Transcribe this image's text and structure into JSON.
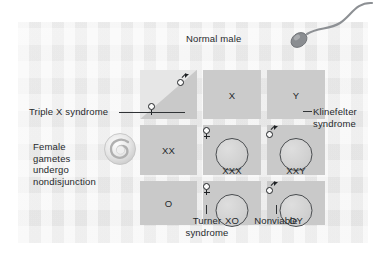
{
  "figure": {
    "title_label": "Normal male",
    "grid": {
      "corner_cell": {
        "male_symbol": "male-symbol",
        "female_symbol": "female-symbol"
      },
      "column_headers": [
        "X",
        "Y"
      ],
      "row_headers": [
        "XX",
        "O"
      ],
      "cells": [
        {
          "genotype": "XXX",
          "sex_symbol": "female-symbol",
          "outcome": "Triple X syndrome"
        },
        {
          "genotype": "XXY",
          "sex_symbol": "male-symbol",
          "outcome": "Klinefelter syndrome"
        },
        {
          "genotype": "XO",
          "sex_symbol": "female-symbol",
          "outcome": "Turner syndrome"
        },
        {
          "genotype": "OY",
          "sex_symbol": "male-symbol",
          "outcome": "Nonviable"
        }
      ]
    },
    "callouts": {
      "normal_male": "Normal male",
      "triple_x": "Triple X syndrome",
      "female_gametes": "Female\ngametes\nundergo\nnondisjunction",
      "klinefelter": "Klinefelter\nsyndrome",
      "turner": "Turner\nsyndrome",
      "nonviable": "Nonviable"
    },
    "graphics": {
      "sperm": "sperm-cell-icon",
      "egg": "egg-cell-icon"
    },
    "colors": {
      "panel_background": "#ececec",
      "grid_cell": "#c9c9c9",
      "grid_gutter": "#f2f2f2",
      "text": "#26292c",
      "outline": "#4a4d50",
      "page_background": "#ffffff"
    }
  }
}
